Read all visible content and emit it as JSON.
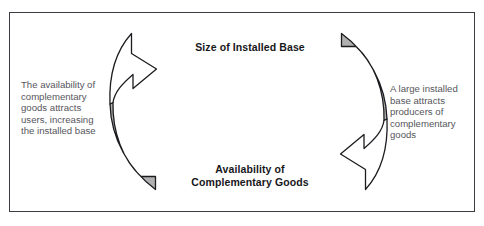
{
  "diagram": {
    "frame": {
      "border_color": "#3b3b42",
      "background_color": "#ffffff"
    },
    "nodes": {
      "top": {
        "name": "size-of-installed-base",
        "lines": [
          "Size of Installed Base"
        ],
        "text": "Size of Installed Base"
      },
      "bottom": {
        "name": "availability-of-complementary-goods",
        "lines": [
          "Availability of",
          "Complementary Goods"
        ],
        "text": "Availability of Complementary Goods"
      }
    },
    "annotations": {
      "left": {
        "name": "left-annotation",
        "lines": [
          "The availability of",
          "complementary",
          "goods attracts",
          "users, increasing",
          "the installed base"
        ],
        "text": "The availability of complementary goods attracts users, increasing the installed base"
      },
      "right": {
        "name": "right-annotation",
        "lines": [
          "A large installed",
          "base attracts",
          "producers of",
          "complementary",
          "goods"
        ],
        "text": "A large installed base attracts producers of complementary goods"
      }
    },
    "arrows": {
      "left": {
        "name": "left-curved-arrow-upward",
        "direction": "upward",
        "fill_white": "#ffffff",
        "fill_gray": "#b0b0b0",
        "stroke": "#1c1c20"
      },
      "right": {
        "name": "right-curved-arrow-downward",
        "direction": "downward",
        "fill_white": "#ffffff",
        "fill_gray": "#b0b0b0",
        "stroke": "#1c1c20"
      }
    },
    "colors": {
      "border": "#3b3b42",
      "label_text": "#17171a",
      "body_text": "#56565c",
      "arrow_gray": "#b0b0b0",
      "arrow_stroke": "#1c1c20"
    }
  }
}
